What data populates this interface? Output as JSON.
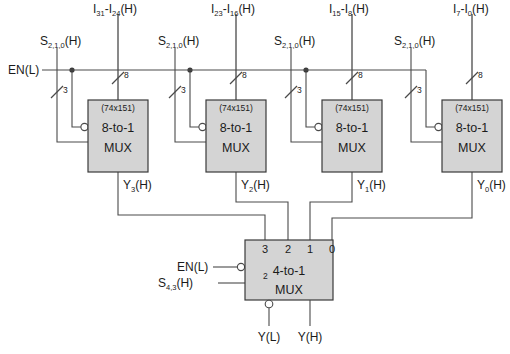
{
  "diagram": {
    "enable_label": "EN(L)",
    "select_label_main": "S",
    "select_sub_main": "2,1,0",
    "select_suffix_main": "(H)",
    "select_label_low": "S",
    "select_sub_low": "4,3",
    "select_suffix_low": "(H)",
    "bus_width_data": "8",
    "bus_width_select": "3",
    "bus_width_select_low": "2",
    "mux8": [
      {
        "part": "(74x151)",
        "line1": "8-to-1",
        "line2": "MUX",
        "data_in_base": "I",
        "data_in_hi": "31",
        "data_in_lo": "24",
        "data_in_suffix": "(H)",
        "select_label": "S",
        "select_sub": "2,1,0",
        "select_suffix": "(H)",
        "out_base": "Y",
        "out_sub": "3",
        "out_suffix": "(H)"
      },
      {
        "part": "(74x151)",
        "line1": "8-to-1",
        "line2": "MUX",
        "data_in_base": "I",
        "data_in_hi": "23",
        "data_in_lo": "16",
        "data_in_suffix": "(H)",
        "select_label": "S",
        "select_sub": "2,1,0",
        "select_suffix": "(H)",
        "out_base": "Y",
        "out_sub": "2",
        "out_suffix": "(H)"
      },
      {
        "part": "(74x151)",
        "line1": "8-to-1",
        "line2": "MUX",
        "data_in_base": "I",
        "data_in_hi": "15",
        "data_in_lo": "8",
        "data_in_suffix": "(H)",
        "select_label": "S",
        "select_sub": "2,1,0",
        "select_suffix": "(H)",
        "out_base": "Y",
        "out_sub": "1",
        "out_suffix": "(H)"
      },
      {
        "part": "(74x151)",
        "line1": "8-to-1",
        "line2": "MUX",
        "data_in_base": "I",
        "data_in_hi": "7",
        "data_in_lo": "0",
        "data_in_suffix": "(H)",
        "select_label": "S",
        "select_sub": "2,1,0",
        "select_suffix": "(H)",
        "out_base": "Y",
        "out_sub": "0",
        "out_suffix": "(H)"
      }
    ],
    "mux4": {
      "line1": "4-to-1",
      "line2": "MUX",
      "inputs": [
        "3",
        "2",
        "1",
        "0"
      ],
      "enable_label": "EN(L)",
      "out_low": "Y(L)",
      "out_high": "Y(H)"
    },
    "colors": {
      "box_fill": "#d4d4d4",
      "box_stroke": "#3a3a3a",
      "wire": "#4a4a4a",
      "text": "#1b1b1b",
      "background": "#ffffff"
    }
  }
}
